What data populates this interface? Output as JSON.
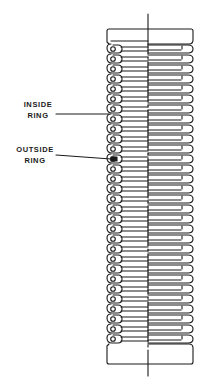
{
  "diagram": {
    "colors": {
      "ink": "#1a1a1a",
      "background": "#ffffff"
    },
    "labels": [
      {
        "id": "inside-ring",
        "lines": [
          "INSIDE",
          "RING"
        ]
      },
      {
        "id": "outside-ring",
        "lines": [
          "OUTSIDE",
          "RING"
        ]
      }
    ],
    "convolutions": {
      "count": 30,
      "pitch_px": 10
    }
  }
}
